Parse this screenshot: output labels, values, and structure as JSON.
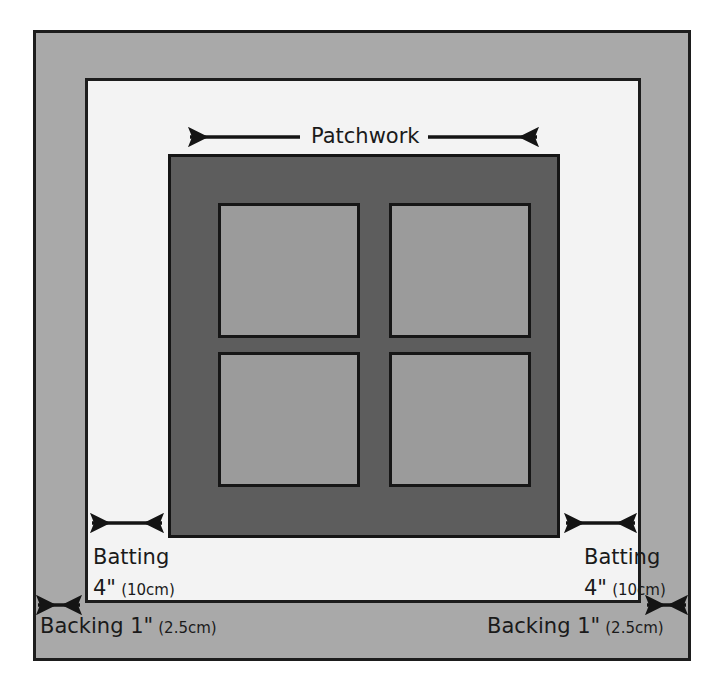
{
  "diagram": {
    "layers": [
      {
        "id": "backing",
        "name": "Backing",
        "color": "#a9a9a9",
        "label": "Backing 1\"",
        "measure_metric": "(2.5cm)",
        "measure_imperial": "1\"",
        "overhang_inches": 1,
        "overhang_cm": 2.5
      },
      {
        "id": "batting",
        "name": "Batting",
        "color": "#f3f3f3",
        "label": "Batting",
        "measure_imperial": "4\"",
        "measure_metric": "(10cm)",
        "overhang_inches": 4,
        "overhang_cm": 10
      },
      {
        "id": "patchwork",
        "name": "Patchwork",
        "color": "#5d5d5d",
        "label": "Patchwork"
      }
    ],
    "patch_squares": {
      "count": 4,
      "color": "#9b9b9b",
      "arrangement": "2x2"
    },
    "labels": {
      "patchwork": "Patchwork",
      "batting_left_title": "Batting",
      "batting_left_imperial": "4\"",
      "batting_left_metric": "(10cm)",
      "batting_right_title": "Batting",
      "batting_right_imperial": "4\"",
      "batting_right_metric": "(10cm)",
      "backing_left_title": "Backing 1\"",
      "backing_left_metric": "(2.5cm)",
      "backing_right_title": "Backing 1\"",
      "backing_right_metric": "(2.5cm)"
    },
    "colors": {
      "backing": "#a9a9a9",
      "batting": "#f3f3f3",
      "patchwork": "#5d5d5d",
      "patch": "#9b9b9b",
      "outline": "#1a1a1a",
      "text": "#1a1a1a"
    }
  }
}
